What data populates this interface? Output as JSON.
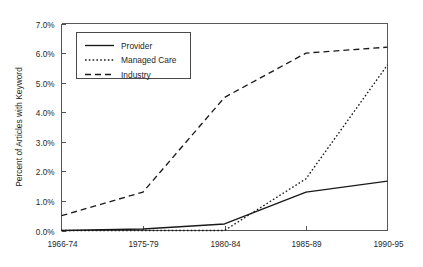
{
  "chart_data": {
    "type": "line",
    "title": "",
    "xlabel": "",
    "ylabel": "Percent of Articles with Keyword",
    "categories": [
      "1966-74",
      "1975-79",
      "1980-84",
      "1985-89",
      "1990-95"
    ],
    "ylim": [
      0.0,
      7.0
    ],
    "yticks": [
      0.0,
      1.0,
      2.0,
      3.0,
      4.0,
      5.0,
      6.0,
      7.0
    ],
    "ytick_labels": [
      "0.0%",
      "1.0%",
      "2.0%",
      "3.0%",
      "4.0%",
      "5.0%",
      "6.0%",
      "7.0%"
    ],
    "grid": false,
    "legend_position": "upper-left-inside",
    "units": "percent",
    "series": [
      {
        "name": "Provider",
        "style": "solid",
        "color": "#1a1a1a",
        "values": [
          0.0,
          0.05,
          0.22,
          1.3,
          1.67
        ]
      },
      {
        "name": "Managed Care",
        "style": "dotted",
        "color": "#1a1a1a",
        "values": [
          0.0,
          0.0,
          0.0,
          1.75,
          5.6
        ]
      },
      {
        "name": "Industry",
        "style": "dashed",
        "color": "#1a1a1a",
        "values": [
          0.5,
          1.3,
          4.5,
          6.0,
          6.2
        ]
      }
    ]
  },
  "legend": {
    "items": [
      {
        "label": "Provider",
        "style": "solid"
      },
      {
        "label": "Managed Care",
        "style": "dotted"
      },
      {
        "label": "Industry",
        "style": "dashed"
      }
    ]
  },
  "axes": {
    "y_axis_title": "Percent of Articles with Keyword",
    "y_ticks": [
      "7.0%",
      "6.0%",
      "5.0%",
      "4.0%",
      "3.0%",
      "2.0%",
      "1.0%",
      "0.0%"
    ],
    "x_ticks": [
      "1966-74",
      "1975-79",
      "1980-84",
      "1985-89",
      "1990-95"
    ]
  }
}
